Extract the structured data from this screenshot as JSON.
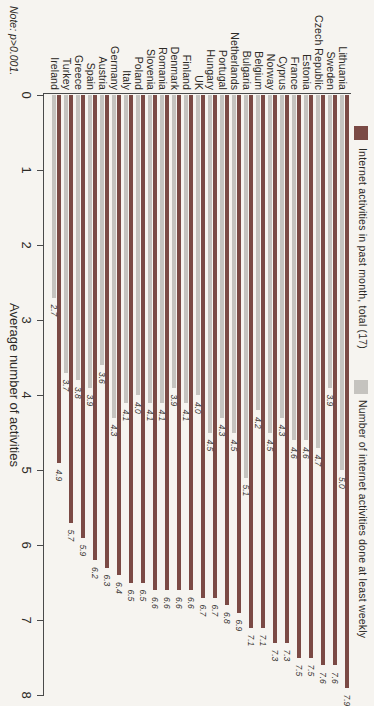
{
  "note": "Note: p>0.001.",
  "x_axis": {
    "title": "Average number of activities",
    "min": 0,
    "max": 8,
    "ticks": [
      0,
      1,
      2,
      3,
      4,
      5,
      6,
      7,
      8
    ]
  },
  "legend": {
    "position": "top",
    "items": [
      {
        "label": "Internet activities in past month, total (17)",
        "color": "#7b4a45"
      },
      {
        "label": "Number of internet activities done at least weekly",
        "color": "#c5c3bf"
      }
    ]
  },
  "colors": {
    "background": "#f6f4f0",
    "axis": "#4a4a4a",
    "value_label_text": "#3a3734",
    "bar_total": "#7b4a45",
    "bar_weekly": "#c5c3bf"
  },
  "chart_data": {
    "type": "bar",
    "orientation": "horizontal",
    "rotated_90_clockwise": true,
    "title": "",
    "xlabel": "Average number of activities",
    "ylabel": "",
    "xlim": [
      0,
      8
    ],
    "grid": false,
    "legend_position": "top",
    "note": "Note: p>0.001.",
    "categories": [
      "Lithuania",
      "Sweden",
      "Czech Republic",
      "Estonia",
      "France",
      "Cyprus",
      "Norway",
      "Belgium",
      "Bulgaria",
      "Netherlands",
      "Portugal",
      "Hungary",
      "UK",
      "Finland",
      "Denmark",
      "Romania",
      "Slovenia",
      "Poland",
      "Italy",
      "Germany",
      "Austria",
      "Spain",
      "Greece",
      "Turkey",
      "Ireland"
    ],
    "series": [
      {
        "name": "Internet activities in past month, total (17)",
        "color": "#7b4a45",
        "values": [
          7.9,
          7.6,
          7.6,
          7.5,
          7.5,
          7.3,
          7.3,
          7.1,
          7.1,
          6.9,
          6.8,
          6.7,
          6.7,
          6.6,
          6.6,
          6.6,
          6.6,
          6.5,
          6.5,
          6.4,
          6.3,
          6.2,
          5.9,
          5.7,
          4.9
        ]
      },
      {
        "name": "Number of internet activities done at least weekly",
        "color": "#c5c3bf",
        "values": [
          5.0,
          3.9,
          4.7,
          4.6,
          4.6,
          4.3,
          4.5,
          4.2,
          5.1,
          4.5,
          4.3,
          4.5,
          4.0,
          4.1,
          3.9,
          4.1,
          4.1,
          4.0,
          4.1,
          4.3,
          3.6,
          3.9,
          3.8,
          3.7,
          2.7
        ]
      }
    ]
  }
}
